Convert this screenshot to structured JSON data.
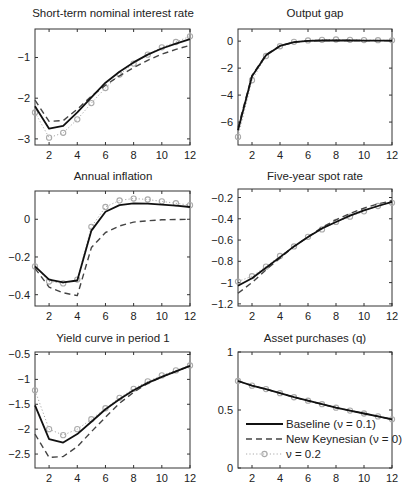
{
  "figure": {
    "x_ticks": [
      2,
      4,
      6,
      8,
      10,
      12
    ],
    "colors": {
      "baseline": "#111111",
      "new_keynesian": "#444444",
      "nu02": "#aaaaaa",
      "axis": "#333333"
    }
  },
  "legend": {
    "entries": [
      {
        "key": "baseline",
        "label": "Baseline (ν = 0.1)",
        "style": "solid"
      },
      {
        "key": "new_keynesian",
        "label": "New Keynesian (ν = 0)",
        "style": "dashed"
      },
      {
        "key": "nu02",
        "label": "ν = 0.2",
        "style": "dotted-circle"
      }
    ]
  },
  "chart_data": [
    {
      "type": "line",
      "title": "Short-term nominal interest rate",
      "xlabel": "",
      "ylabel": "",
      "x": [
        1,
        2,
        3,
        4,
        5,
        6,
        7,
        8,
        9,
        10,
        11,
        12
      ],
      "xlim": [
        1,
        12
      ],
      "ylim": [
        -3.15,
        -0.3
      ],
      "yticks": [
        -3,
        -2,
        -1
      ],
      "ytick_labels": [
        "−3",
        "−2",
        "−1"
      ],
      "series": [
        {
          "name": "Baseline (ν = 0.1)",
          "values": [
            -2.2,
            -2.75,
            -2.68,
            -2.35,
            -1.98,
            -1.62,
            -1.35,
            -1.12,
            -0.93,
            -0.78,
            -0.66,
            -0.55
          ]
        },
        {
          "name": "New Keynesian (ν = 0)",
          "values": [
            -2.05,
            -2.57,
            -2.55,
            -2.27,
            -1.95,
            -1.68,
            -1.45,
            -1.25,
            -1.07,
            -0.92,
            -0.8,
            -0.7
          ]
        },
        {
          "name": "ν = 0.2",
          "values": [
            -2.35,
            -2.97,
            -2.85,
            -2.52,
            -2.12,
            -1.75,
            -1.42,
            -1.15,
            -0.93,
            -0.75,
            -0.62,
            -0.48
          ]
        }
      ],
      "grid": false
    },
    {
      "type": "line",
      "title": "Output gap",
      "xlabel": "",
      "ylabel": "",
      "x": [
        1,
        2,
        3,
        4,
        5,
        6,
        7,
        8,
        9,
        10,
        11,
        12
      ],
      "xlim": [
        1,
        12
      ],
      "ylim": [
        -7.7,
        0.9
      ],
      "yticks": [
        -6,
        -4,
        -2,
        0
      ],
      "ytick_labels": [
        "−6",
        "−4",
        "−2",
        "0"
      ],
      "series": [
        {
          "name": "Baseline (ν = 0.1)",
          "values": [
            -6.6,
            -2.6,
            -1.05,
            -0.35,
            -0.08,
            0.02,
            0.05,
            0.05,
            0.05,
            0.04,
            0.04,
            0.03
          ]
        },
        {
          "name": "New Keynesian (ν = 0)",
          "values": [
            -6.4,
            -2.55,
            -1.0,
            -0.35,
            -0.08,
            0.02,
            0.05,
            0.05,
            0.05,
            0.04,
            0.04,
            0.03
          ]
        },
        {
          "name": "ν = 0.2",
          "values": [
            -7.1,
            -2.9,
            -1.1,
            -0.38,
            -0.05,
            0.05,
            0.1,
            0.12,
            0.1,
            0.08,
            0.07,
            0.06
          ]
        }
      ],
      "grid": false
    },
    {
      "type": "line",
      "title": "Annual inflation",
      "xlabel": "",
      "ylabel": "",
      "x": [
        1,
        2,
        3,
        4,
        5,
        6,
        7,
        8,
        9,
        10,
        11,
        12
      ],
      "xlim": [
        1,
        12
      ],
      "ylim": [
        -0.46,
        0.15
      ],
      "yticks": [
        -0.4,
        -0.2,
        0
      ],
      "ytick_labels": [
        "−0.4",
        "−0.2",
        "0"
      ],
      "series": [
        {
          "name": "Baseline (ν = 0.1)",
          "values": [
            -0.25,
            -0.32,
            -0.335,
            -0.325,
            -0.06,
            0.04,
            0.075,
            0.085,
            0.083,
            0.078,
            0.072,
            0.065
          ]
        },
        {
          "name": "New Keynesian (ν = 0)",
          "values": [
            -0.26,
            -0.36,
            -0.39,
            -0.405,
            -0.15,
            -0.07,
            -0.035,
            -0.015,
            -0.008,
            -0.003,
            -0.001,
            0.0
          ]
        },
        {
          "name": "ν = 0.2",
          "values": [
            -0.25,
            -0.33,
            -0.34,
            -0.32,
            -0.04,
            0.065,
            0.1,
            0.11,
            0.105,
            0.095,
            0.085,
            0.075
          ]
        }
      ],
      "grid": false
    },
    {
      "type": "line",
      "title": "Five-year spot rate",
      "xlabel": "",
      "ylabel": "",
      "x": [
        1,
        2,
        3,
        4,
        5,
        6,
        7,
        8,
        9,
        10,
        11,
        12
      ],
      "xlim": [
        1,
        12
      ],
      "ylim": [
        -1.22,
        -0.12
      ],
      "yticks": [
        -1.2,
        -1,
        -0.8,
        -0.6,
        -0.4,
        -0.2
      ],
      "ytick_labels": [
        "−1.2",
        "−1",
        "−0.8",
        "−0.6",
        "−0.4",
        "−0.2"
      ],
      "series": [
        {
          "name": "Baseline (ν = 0.1)",
          "values": [
            -1.03,
            -0.96,
            -0.86,
            -0.76,
            -0.66,
            -0.57,
            -0.49,
            -0.43,
            -0.37,
            -0.32,
            -0.28,
            -0.24
          ]
        },
        {
          "name": "New Keynesian (ν = 0)",
          "values": [
            -1.1,
            -1.0,
            -0.88,
            -0.77,
            -0.66,
            -0.57,
            -0.48,
            -0.41,
            -0.35,
            -0.3,
            -0.26,
            -0.23
          ]
        },
        {
          "name": "ν = 0.2",
          "values": [
            -0.99,
            -0.94,
            -0.85,
            -0.75,
            -0.66,
            -0.57,
            -0.5,
            -0.43,
            -0.38,
            -0.33,
            -0.28,
            -0.25
          ]
        }
      ],
      "grid": false
    },
    {
      "type": "line",
      "title": "Yield curve in period 1",
      "xlabel": "",
      "ylabel": "",
      "x": [
        1,
        2,
        3,
        4,
        5,
        6,
        7,
        8,
        9,
        10,
        11,
        12
      ],
      "xlim": [
        1,
        12
      ],
      "ylim": [
        -2.78,
        -0.45
      ],
      "yticks": [
        -2.5,
        -2,
        -1.5,
        -1,
        -0.5
      ],
      "ytick_labels": [
        "−2.5",
        "−2",
        "−1.5",
        "−1",
        "−0.5"
      ],
      "series": [
        {
          "name": "Baseline (ν = 0.1)",
          "values": [
            -1.52,
            -2.2,
            -2.27,
            -2.1,
            -1.85,
            -1.6,
            -1.4,
            -1.22,
            -1.07,
            -0.95,
            -0.84,
            -0.73
          ]
        },
        {
          "name": "New Keynesian (ν = 0)",
          "values": [
            -2.1,
            -2.57,
            -2.55,
            -2.35,
            -2.05,
            -1.76,
            -1.48,
            -1.26,
            -1.08,
            -0.95,
            -0.84,
            -0.73
          ]
        },
        {
          "name": "ν = 0.2",
          "values": [
            -1.22,
            -2.0,
            -2.12,
            -2.0,
            -1.8,
            -1.58,
            -1.37,
            -1.19,
            -1.04,
            -0.92,
            -0.82,
            -0.72
          ]
        }
      ],
      "grid": false
    },
    {
      "type": "line",
      "title": "Asset purchases (q)",
      "xlabel": "",
      "ylabel": "",
      "x": [
        1,
        2,
        3,
        4,
        5,
        6,
        7,
        8,
        9,
        10,
        11,
        12
      ],
      "xlim": [
        1,
        12
      ],
      "ylim": [
        0,
        1
      ],
      "yticks": [
        0,
        0.5,
        1
      ],
      "ytick_labels": [
        "0",
        "0.5",
        "1"
      ],
      "series": [
        {
          "name": "Baseline (ν = 0.1)",
          "values": [
            0.75,
            0.71,
            0.68,
            0.645,
            0.61,
            0.58,
            0.55,
            0.52,
            0.495,
            0.47,
            0.445,
            0.42
          ]
        },
        {
          "name": "New Keynesian (ν = 0)",
          "values": [
            0.75,
            0.71,
            0.68,
            0.645,
            0.61,
            0.58,
            0.55,
            0.52,
            0.495,
            0.47,
            0.445,
            0.42
          ]
        },
        {
          "name": "ν = 0.2",
          "values": [
            0.75,
            0.71,
            0.68,
            0.645,
            0.61,
            0.58,
            0.55,
            0.52,
            0.495,
            0.47,
            0.445,
            0.42
          ]
        }
      ],
      "legend_position": "lower left",
      "grid": false
    }
  ]
}
